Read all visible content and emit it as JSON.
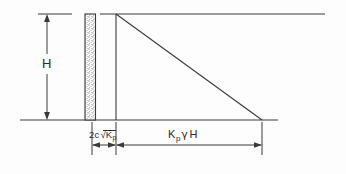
{
  "figure": {
    "type": "engineering-diagram",
    "background_color": "#fdfdfd",
    "line_color": "#3a3a3a",
    "wall_fill": "stippled"
  },
  "labels": {
    "height": "H",
    "cohesion_term_prefix": "2c",
    "cohesion_term_radical": "K",
    "cohesion_term_subscript": "p",
    "passive_k": "K",
    "passive_k_subscript": "p",
    "passive_gamma": "γ",
    "passive_h": "H"
  },
  "dimensions": {
    "height_label": "H",
    "cohesion_label": "2c√Kp",
    "passive_label": "Kp γ H"
  },
  "geometry": {
    "ground_line_y": 120,
    "top_line_y": 14,
    "wall_left_x": 85,
    "wall_right_x": 95,
    "pressure_left_x": 116,
    "pressure_right_x": 262,
    "wall_height": 106
  }
}
